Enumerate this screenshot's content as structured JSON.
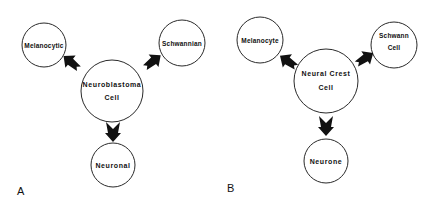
{
  "figure": {
    "panels": [
      {
        "letter": "A",
        "center": {
          "line1": "Neuroblastoma",
          "line2": "Cell"
        },
        "left": {
          "line1": "Melanocytic",
          "line2": ""
        },
        "right": {
          "line1": "Schwannian",
          "line2": ""
        },
        "bottom": {
          "line1": "Neuronal",
          "line2": ""
        }
      },
      {
        "letter": "B",
        "center": {
          "line1": "Neural Crest",
          "line2": "Cell"
        },
        "left": {
          "line1": "Melanocyte",
          "line2": ""
        },
        "right": {
          "line1": "Schwann",
          "line2": "Cell"
        },
        "bottom": {
          "line1": "Neurone",
          "line2": ""
        }
      }
    ],
    "colors": {
      "background": "#ffffff",
      "stroke": "#2a2a2a",
      "arrow": "#111111",
      "text": "#111111"
    }
  }
}
